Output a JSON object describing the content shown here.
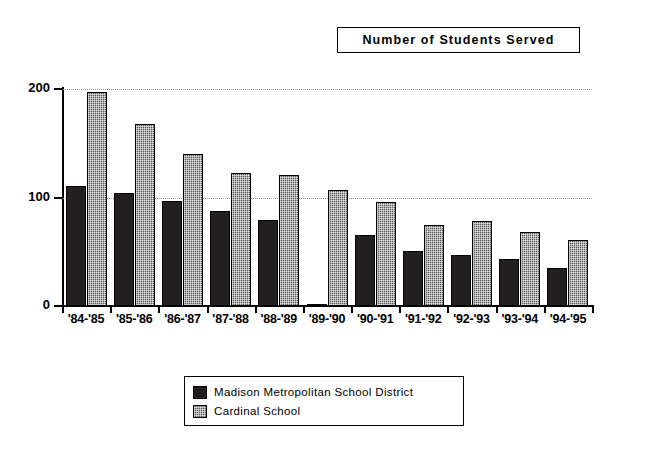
{
  "title": {
    "text": "Number of Students Served"
  },
  "chart_data": {
    "type": "bar",
    "title": "Number of Students Served",
    "xlabel": "",
    "ylabel": "",
    "ylim": [
      0,
      200
    ],
    "yticks": [
      0,
      100,
      200
    ],
    "grid": true,
    "legend_position": "bottom-center",
    "categories": [
      "'84-'85",
      "'85-'86",
      "'86-'87",
      "'87-'88",
      "'88-'89",
      "'89-'90",
      "'90-'91",
      "'91-'92",
      "'92-'93",
      "'93-'94",
      "'94-'95"
    ],
    "series": [
      {
        "name": "Madison Metropolitan School District",
        "color": "#231f20",
        "pattern": "solid",
        "values": [
          111,
          104,
          97,
          88,
          79,
          2,
          65,
          51,
          47,
          43,
          35
        ]
      },
      {
        "name": "Cardinal School",
        "color": "#585858",
        "pattern": "dither",
        "values": [
          197,
          168,
          140,
          123,
          121,
          107,
          96,
          75,
          78,
          68,
          61
        ]
      }
    ]
  },
  "legend": {
    "entries": [
      {
        "label": "Madison Metropolitan School District",
        "pattern": "solid"
      },
      {
        "label": "Cardinal School",
        "pattern": "dither"
      }
    ]
  }
}
